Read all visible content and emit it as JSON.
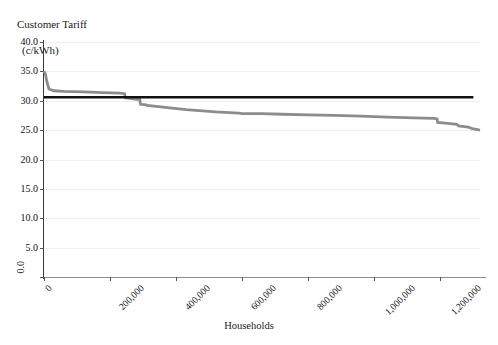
{
  "chart_data": {
    "type": "line",
    "title": "",
    "ylabel": "Customer Tariff\n(c/kWh)",
    "ylabel_line1": "Customer Tariff",
    "ylabel_line2": "(c/kWh)",
    "xlabel": "Households",
    "xlim": [
      0,
      1320000
    ],
    "ylim": [
      0,
      40
    ],
    "grid": true,
    "legend": "none",
    "y_ticks": [
      "40.0",
      "35.0",
      "30.0",
      "25.0",
      "20.0",
      "15.0",
      "10.0",
      "5.0",
      "0.0"
    ],
    "y_tick_values": [
      40,
      35,
      30,
      25,
      20,
      15,
      10,
      5,
      0
    ],
    "x_ticks": [
      "0",
      "200,000",
      "400,000",
      "600,000",
      "800,000",
      "1,000,000",
      "1,200,000"
    ],
    "x_tick_values": [
      0,
      200000,
      400000,
      600000,
      800000,
      1000000,
      1200000
    ],
    "series": [
      {
        "name": "customer-tariff-curve",
        "color": "#8c8c8c",
        "type": "step-line",
        "x": [
          0,
          4000,
          9000,
          15000,
          30000,
          60000,
          120000,
          180000,
          230000,
          244000,
          246000,
          258000,
          260000,
          275000,
          290000,
          292000,
          310000,
          312000,
          360000,
          430000,
          520000,
          590000,
          600000,
          660000,
          720000,
          800000,
          880000,
          960000,
          1040000,
          1120000,
          1180000,
          1190000,
          1192000,
          1230000,
          1250000,
          1255000,
          1285000,
          1300000,
          1320000
        ],
        "y": [
          35.0,
          34.6,
          33.2,
          32.0,
          31.7,
          31.6,
          31.5,
          31.4,
          31.3,
          31.2,
          30.5,
          30.4,
          30.4,
          30.3,
          30.2,
          29.4,
          29.3,
          29.2,
          28.9,
          28.5,
          28.1,
          27.9,
          27.8,
          27.8,
          27.7,
          27.6,
          27.5,
          27.4,
          27.2,
          27.1,
          27.0,
          26.9,
          26.3,
          26.1,
          26.0,
          25.7,
          25.5,
          25.2,
          25.0
        ]
      },
      {
        "name": "reference-threshold-line",
        "color": "#111111",
        "type": "hline",
        "value": 30.6
      }
    ]
  }
}
